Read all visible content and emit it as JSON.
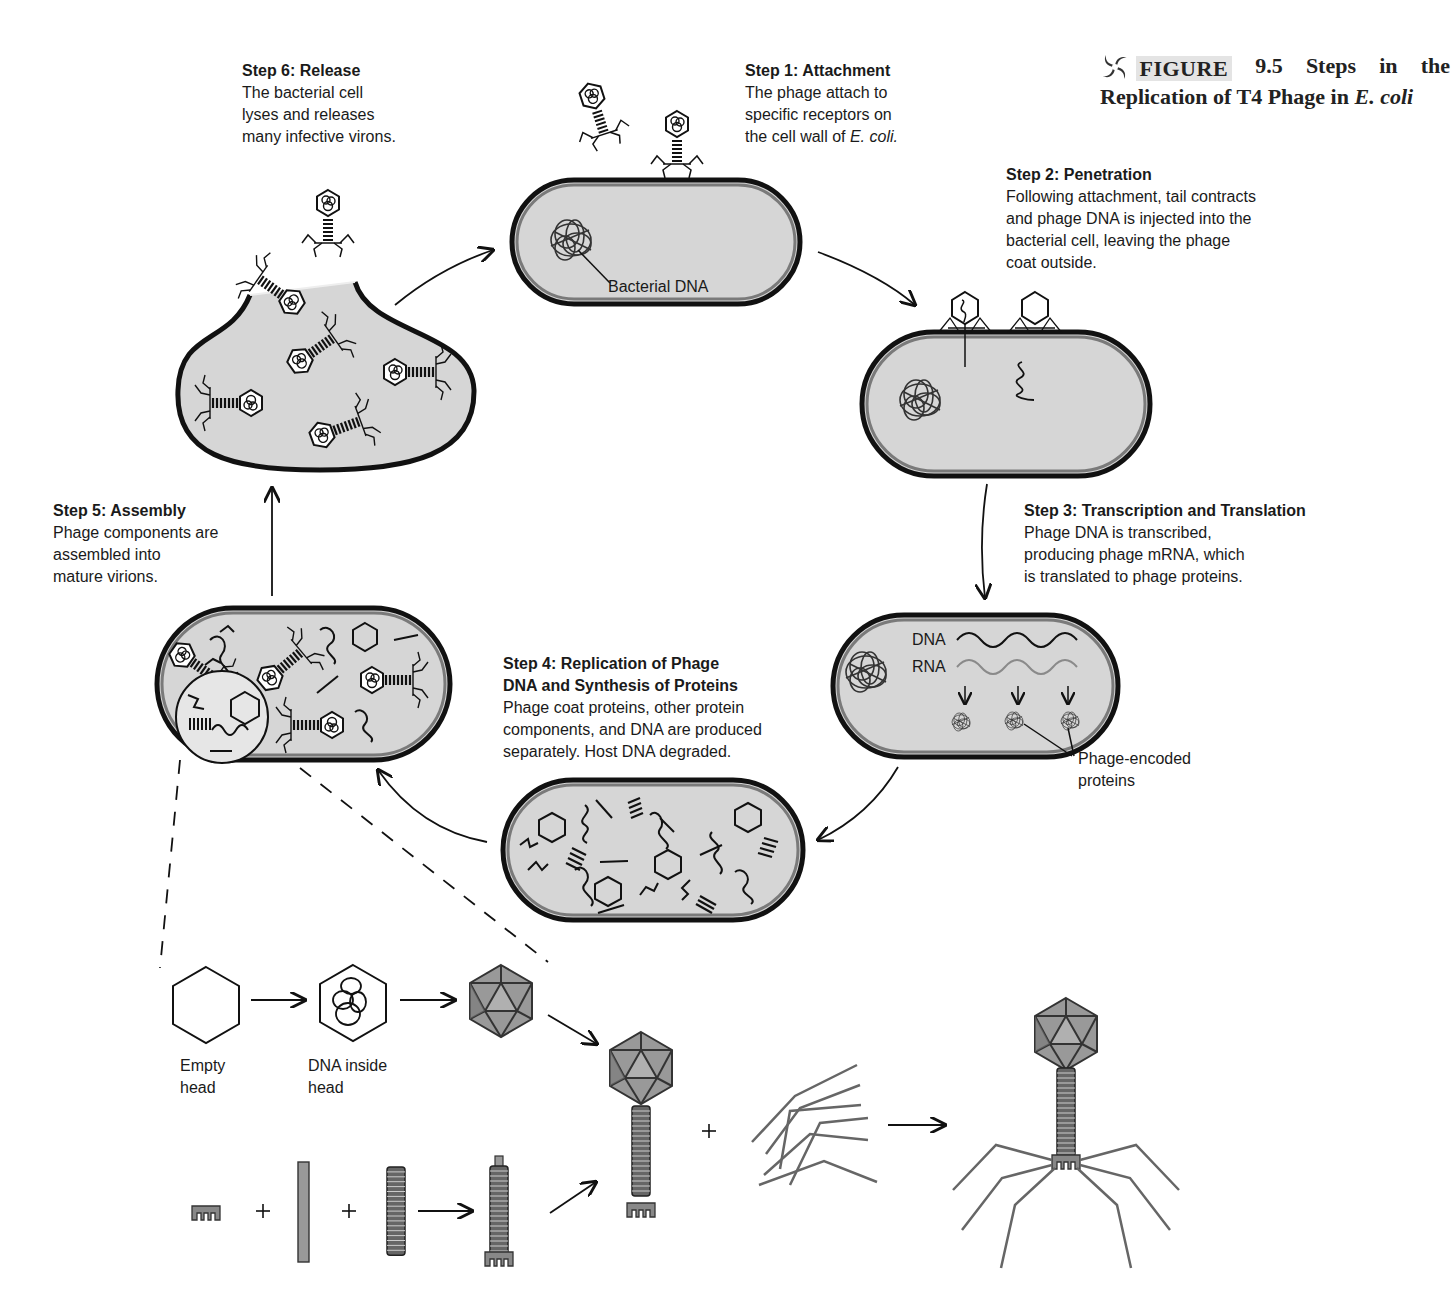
{
  "figure": {
    "number_label": "FIGURE",
    "number": "9.5",
    "title_line1_words": [
      "Steps",
      "in",
      "the"
    ],
    "title_line2_prefix": "Replication of T4 Phage in ",
    "title_line2_italic": "E. coli",
    "icon": "swirl-logo-icon"
  },
  "steps": [
    {
      "id": "step1",
      "heading": "Step 1: Attachment",
      "lines": [
        "The phage attach to",
        "specific receptors on",
        "the cell wall of "
      ],
      "italic_tail": "E. coli."
    },
    {
      "id": "step2",
      "heading": "Step 2: Penetration",
      "lines": [
        "Following attachment, tail contracts",
        "and phage DNA is injected into the",
        "bacterial cell, leaving the phage",
        "coat outside."
      ]
    },
    {
      "id": "step3",
      "heading": "Step 3: Transcription and Translation",
      "lines": [
        "Phage DNA is transcribed,",
        "producing phage mRNA, which",
        "is translated to phage proteins."
      ]
    },
    {
      "id": "step4",
      "heading_lines": [
        "Step 4: Replication of Phage",
        "DNA and Synthesis of Proteins"
      ],
      "lines": [
        "Phage coat proteins, other protein",
        "components, and DNA are produced",
        "separately. Host DNA degraded."
      ]
    },
    {
      "id": "step5",
      "heading": "Step 5: Assembly",
      "lines": [
        "Phage components are",
        "assembled into",
        "mature virions."
      ]
    },
    {
      "id": "step6",
      "heading": "Step 6: Release",
      "lines": [
        "The bacterial cell",
        "lyses and releases",
        "many infective virons."
      ]
    }
  ],
  "annotations": {
    "bacterial_dna": "Bacterial DNA",
    "dna": "DNA",
    "rna": "RNA",
    "phage_encoded_proteins": [
      "Phage-encoded",
      "proteins"
    ],
    "empty_head": [
      "Empty",
      "head"
    ],
    "dna_inside_head": [
      "DNA inside",
      "head"
    ],
    "plus": "+"
  },
  "colors": {
    "cell_fill": "#d6d6d6",
    "cell_wall_outer": "#111111",
    "cell_wall_inner": "#7a7a7a",
    "capsid_fill": "#8f8f8f",
    "capsid_light": "#b3b3b3",
    "mrna_gray": "#8a8a8a",
    "text": "#1a1a1a"
  }
}
